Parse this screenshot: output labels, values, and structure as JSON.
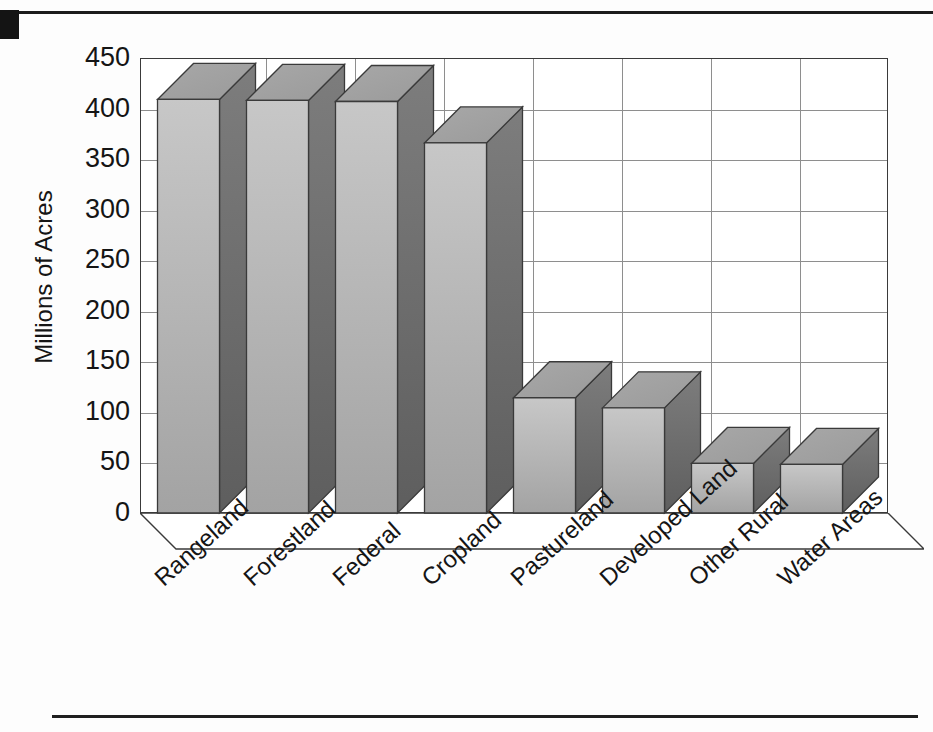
{
  "page": {
    "corner_mark": "black-square",
    "top_rule": true,
    "bottom_rule": true
  },
  "chart_data": {
    "type": "bar",
    "title": "",
    "subtitle": "",
    "xlabel": "",
    "ylabel": "Millions of Acres",
    "ylim": [
      0,
      450
    ],
    "ytick_step": 50,
    "yticks": [
      "450",
      "400",
      "350",
      "300",
      "250",
      "200",
      "150",
      "100",
      "50",
      "0"
    ],
    "grid": true,
    "grid_axis": "both",
    "legend": false,
    "style": "3d-column",
    "categories": [
      "Rangeland",
      "Forestland",
      "Federal",
      "Cropland",
      "Pastureland",
      "Developed Land",
      "Other Rural",
      "Water Areas"
    ],
    "values": [
      409,
      408,
      407,
      366,
      114,
      104,
      49,
      48
    ],
    "series": [
      {
        "name": "Millions of Acres",
        "values": [
          409,
          408,
          407,
          366,
          114,
          104,
          49,
          48
        ]
      }
    ]
  },
  "colors": {
    "bar_front": "#b9b9b9",
    "bar_top": "#9d9d9d",
    "bar_side": "#6f6f6f",
    "bar_shadow": "#dcdcdc",
    "grid": "#8e8e8e",
    "frame": "#3a3a3a",
    "text": "#151515",
    "page_background": "#fdfdfd",
    "corner_mark": "#141414"
  }
}
